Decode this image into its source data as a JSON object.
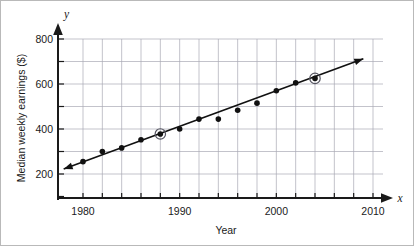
{
  "chart_data": {
    "type": "scatter",
    "title": "",
    "xlabel": "Year",
    "ylabel": "Median weekly earnings ($)",
    "x_axis_variable": "x",
    "y_axis_variable": "y",
    "xlim": [
      1978,
      2010
    ],
    "ylim": [
      100,
      820
    ],
    "x_ticks": [
      1980,
      1982,
      1984,
      1986,
      1988,
      1990,
      1992,
      1994,
      1996,
      1998,
      2000,
      2002,
      2004,
      2006,
      2008,
      2010
    ],
    "x_tick_labels": [
      "1980",
      "",
      "",
      "",
      "",
      "1990",
      "",
      "",
      "",
      "",
      "2000",
      "",
      "",
      "",
      "",
      "2010"
    ],
    "y_ticks": [
      200,
      300,
      400,
      500,
      600,
      700,
      800
    ],
    "y_tick_labels": [
      "200",
      "",
      "400",
      "",
      "600",
      "",
      "800"
    ],
    "y_gridlines": [
      200,
      300,
      400,
      500,
      600,
      700,
      800
    ],
    "grid": true,
    "legend": false,
    "x": [
      1980,
      1982,
      1984,
      1986,
      1988,
      1990,
      1992,
      1994,
      1996,
      1998,
      2000,
      2002,
      2004
    ],
    "values": [
      255,
      300,
      316,
      352,
      378,
      400,
      444,
      444,
      483,
      515,
      570,
      605,
      625
    ],
    "highlighted_points": [
      {
        "x": 1988,
        "y": 378
      },
      {
        "x": 2004,
        "y": 625
      }
    ],
    "trend_line": {
      "type": "line",
      "label": "line of best fit",
      "x_start": 1978,
      "y_start": 222,
      "x_end": 2009,
      "y_end": 712,
      "arrow_both_ends": true
    }
  },
  "axes": {
    "x_arrow_label": "x",
    "y_arrow_label": "y"
  }
}
